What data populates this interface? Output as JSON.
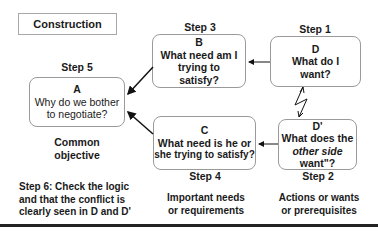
{
  "title": "Construction",
  "boxes": {
    "A": {
      "step": "Step 5",
      "letter": "A",
      "lines": [
        "Why do we bother",
        "to negotiate?"
      ],
      "caption": [
        "Common",
        "objective"
      ]
    },
    "B": {
      "step": "Step 3",
      "letter": "B",
      "lines": [
        "What need am I",
        "trying to",
        "satisfy?"
      ]
    },
    "C": {
      "step": "Step 4",
      "letter": "C",
      "lines": [
        "What need is he or",
        "she trying to satisfy?"
      ],
      "caption": [
        "Important needs",
        "or requirements"
      ]
    },
    "D": {
      "step": "Step 1",
      "letter": "D",
      "lines": [
        "What do I",
        "want?"
      ]
    },
    "Dprime": {
      "step": "Step 2",
      "letter": "D'",
      "line1": "What does the",
      "italic": "other side",
      "line3": "want\"?",
      "caption": [
        "Actions or wants",
        "or prerequisites"
      ]
    }
  },
  "step6": [
    "Step 6: Check the logic",
    "and that the conflict is",
    "clearly seen in D and D'"
  ],
  "colors": {
    "border": "#9a9a9a",
    "text": "#1a1a1a",
    "rule": "#222222"
  }
}
